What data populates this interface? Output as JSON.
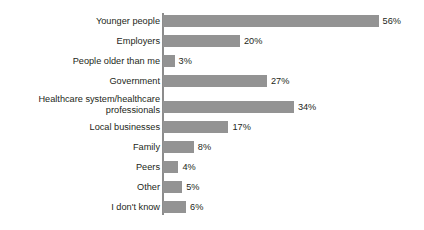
{
  "chart_data": {
    "type": "bar",
    "orientation": "horizontal",
    "title": "",
    "subtitle": "",
    "xlabel": "",
    "ylabel": "",
    "xlim": [
      0,
      60
    ],
    "grid": false,
    "legend": false,
    "value_suffix": "%",
    "bar_color": "#939393",
    "axis_color": "#8c8c8c",
    "text_color": "#231f20",
    "px_per_unit": 3.85,
    "categories": [
      "Younger people",
      "Employers",
      "People older than me",
      "Government",
      "Healthcare system/healthcare\nprofessionals",
      "Local businesses",
      "Family",
      "Peers",
      "Other",
      "I don't know"
    ],
    "values": [
      56,
      20,
      3,
      27,
      34,
      17,
      8,
      4,
      5,
      6
    ],
    "value_labels": [
      "56%",
      "20%",
      "3%",
      "27%",
      "34%",
      "17%",
      "8%",
      "4%",
      "5%",
      "6%"
    ],
    "rows": [
      {
        "label": "Younger people",
        "value": 56,
        "value_label": "56%",
        "tall": false
      },
      {
        "label": "Employers",
        "value": 20,
        "value_label": "20%",
        "tall": false
      },
      {
        "label": "People older than me",
        "value": 3,
        "value_label": "3%",
        "tall": false
      },
      {
        "label": "Government",
        "value": 27,
        "value_label": "27%",
        "tall": false
      },
      {
        "label": "Healthcare system/healthcare\nprofessionals",
        "value": 34,
        "value_label": "34%",
        "tall": true
      },
      {
        "label": "Local businesses",
        "value": 17,
        "value_label": "17%",
        "tall": false
      },
      {
        "label": "Family",
        "value": 8,
        "value_label": "8%",
        "tall": false
      },
      {
        "label": "Peers",
        "value": 4,
        "value_label": "4%",
        "tall": false
      },
      {
        "label": "Other",
        "value": 5,
        "value_label": "5%",
        "tall": false
      },
      {
        "label": "I don't know",
        "value": 6,
        "value_label": "6%",
        "tall": false
      }
    ]
  }
}
